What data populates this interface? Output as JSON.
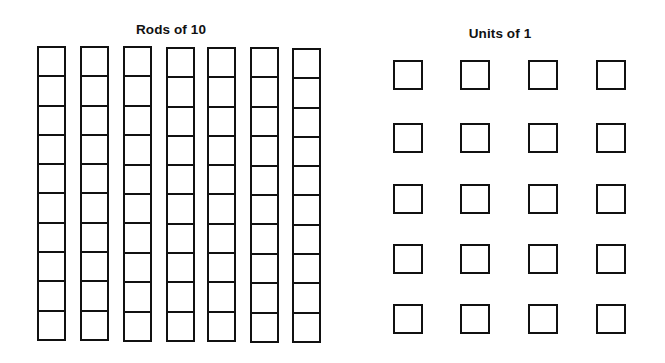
{
  "rods_section": {
    "title": "Rods of 10",
    "title_center_x": 171,
    "title_top_y": 22,
    "rod_count": 7,
    "cells_per_rod": 10,
    "rods": [
      {
        "x": 37,
        "top": 46,
        "bottom": 341
      },
      {
        "x": 80,
        "top": 46,
        "bottom": 341
      },
      {
        "x": 123,
        "top": 46,
        "bottom": 342
      },
      {
        "x": 166,
        "top": 47,
        "bottom": 342
      },
      {
        "x": 207,
        "top": 47,
        "bottom": 342
      },
      {
        "x": 250,
        "top": 47,
        "bottom": 343
      },
      {
        "x": 292,
        "top": 48,
        "bottom": 343
      }
    ]
  },
  "units_section": {
    "title": "Units of 1",
    "title_center_x": 500,
    "title_top_y": 26,
    "unit_count": 20,
    "columns_x": [
      393,
      460,
      528,
      596
    ],
    "rows_y": [
      60,
      123,
      184,
      244,
      304
    ]
  },
  "colors": {
    "stroke": "#111111",
    "background": "#ffffff"
  }
}
